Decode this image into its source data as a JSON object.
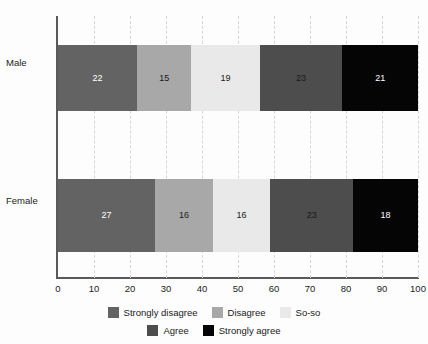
{
  "chart_data": {
    "type": "bar",
    "orientation": "horizontal",
    "stacked": true,
    "stack_mode": "percent",
    "title": "",
    "subtitle": "",
    "xlabel": "",
    "ylabel": "",
    "categories": [
      "Male",
      "Female"
    ],
    "xlim": [
      0,
      100
    ],
    "xticks": [
      0,
      10,
      20,
      30,
      40,
      50,
      60,
      70,
      80,
      90,
      100
    ],
    "xtick_labels": [
      "0",
      "10",
      "20",
      "30",
      "40",
      "50",
      "60",
      "70",
      "80",
      "90",
      "100"
    ],
    "grid": true,
    "grid_axis": "x",
    "grid_style": "dashed",
    "legend_position": "bottom",
    "series": [
      {
        "name": "Strongly disagree",
        "color": "#636363",
        "label_color": "#ffffff",
        "values": [
          22,
          27
        ]
      },
      {
        "name": "Disagree",
        "color": "#a8a8a8",
        "label_color": "#1a1a1a",
        "values": [
          15,
          16
        ]
      },
      {
        "name": "So-so",
        "color": "#e9e9e9",
        "label_color": "#1a1a1a",
        "values": [
          19,
          16
        ]
      },
      {
        "name": "Agree",
        "color": "#4d4d4d",
        "label_color": "#1a1a1a",
        "values": [
          23,
          23
        ]
      },
      {
        "name": "Strongly agree",
        "color": "#050505",
        "label_color": "#ffffff",
        "values": [
          21,
          18
        ]
      }
    ],
    "legend_rows": [
      [
        "Strongly disagree",
        "Disagree",
        "So-so"
      ],
      [
        "Agree",
        "Strongly agree"
      ]
    ]
  }
}
